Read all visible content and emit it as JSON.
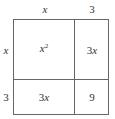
{
  "diagram": {
    "type": "area-model",
    "top_labels": [
      {
        "text": "x",
        "italic": true
      },
      {
        "text": "3",
        "italic": false
      }
    ],
    "side_labels": [
      {
        "text": "x",
        "italic": true
      },
      {
        "text": "3",
        "italic": false
      }
    ],
    "cells": [
      [
        {
          "coef": "",
          "var": "x",
          "exp": "2"
        },
        {
          "coef": "3",
          "var": "x",
          "exp": ""
        }
      ],
      [
        {
          "coef": "3",
          "var": "x",
          "exp": ""
        },
        {
          "coef": "9",
          "var": "",
          "exp": ""
        }
      ]
    ],
    "line_color": "#666666"
  }
}
